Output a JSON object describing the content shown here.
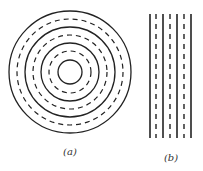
{
  "figure": {
    "stroke_color": "#222222",
    "background": "#ffffff",
    "panels": [
      {
        "id": "a",
        "label": "(a)",
        "description": "Concentric circles alternating solid and dashed",
        "center": [
          70,
          72
        ],
        "rings": [
          {
            "r": 61,
            "style": "solid"
          },
          {
            "r": 53,
            "style": "dashed"
          },
          {
            "r": 45,
            "style": "solid"
          },
          {
            "r": 37,
            "style": "dashed"
          },
          {
            "r": 29,
            "style": "solid"
          },
          {
            "r": 21,
            "style": "dashed"
          },
          {
            "r": 12,
            "style": "solid"
          }
        ]
      },
      {
        "id": "b",
        "label": "(b)",
        "description": "Parallel vertical lines alternating solid and dashed",
        "y_range": [
          14,
          138
        ],
        "lines": [
          {
            "x": 150,
            "style": "solid"
          },
          {
            "x": 156,
            "style": "dashed"
          },
          {
            "x": 163,
            "style": "solid"
          },
          {
            "x": 170,
            "style": "dashed"
          },
          {
            "x": 177,
            "style": "solid"
          },
          {
            "x": 184,
            "style": "dashed"
          },
          {
            "x": 191,
            "style": "solid"
          }
        ]
      }
    ]
  }
}
